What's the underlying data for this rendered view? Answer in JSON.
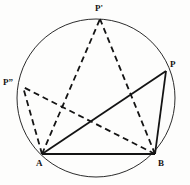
{
  "figure": {
    "width": 190,
    "height": 185,
    "background_color": "#fdfdfc",
    "stroke_color": "#141414",
    "circle": {
      "name": "circumscribed-circle",
      "cx": 96,
      "cy": 98,
      "r": 79,
      "stroke_width": 0.9,
      "style": "solid"
    },
    "points": [
      {
        "id": "Pprime",
        "label": "P'",
        "x": 100,
        "y": 19
      },
      {
        "id": "P",
        "label": "P",
        "x": 166,
        "y": 71
      },
      {
        "id": "Pdouble",
        "label": "P”",
        "x": 23,
        "y": 87
      },
      {
        "id": "A",
        "label": "A",
        "x": 42,
        "y": 154
      },
      {
        "id": "B",
        "label": "B",
        "x": 155,
        "y": 154
      }
    ],
    "segments": [
      {
        "id": "AB",
        "from": "A",
        "to": "B",
        "style": "solid",
        "stroke_width": 2.0
      },
      {
        "id": "AP",
        "from": "A",
        "to": "P",
        "style": "solid",
        "stroke_width": 1.8
      },
      {
        "id": "BP",
        "from": "B",
        "to": "P",
        "style": "solid",
        "stroke_width": 1.8
      },
      {
        "id": "APprime",
        "from": "A",
        "to": "Pprime",
        "style": "dashed",
        "stroke_width": 1.8
      },
      {
        "id": "BPprime",
        "from": "B",
        "to": "Pprime",
        "style": "dashed",
        "stroke_width": 1.8
      },
      {
        "id": "APdouble",
        "from": "A",
        "to": "Pdouble",
        "style": "dashed",
        "stroke_width": 1.8
      },
      {
        "id": "BPdouble",
        "from": "B",
        "to": "Pdouble",
        "style": "dashed",
        "stroke_width": 1.8
      }
    ],
    "dash_pattern": "6 4",
    "labels": {
      "p_prime": "P'",
      "p": "P",
      "p_double": "P”",
      "a": "A",
      "b": "B"
    }
  }
}
